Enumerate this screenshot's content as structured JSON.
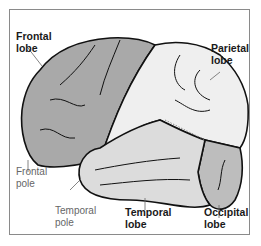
{
  "figure": {
    "colors": {
      "frontal": "#a9a9a9",
      "parietal": "#efefef",
      "temporal": "#dcdcdc",
      "occipital": "#bdbdbd",
      "outline": "#111111",
      "border": "#8a8a8a"
    },
    "labels": {
      "frontal_lobe": [
        "Frontal",
        "lobe"
      ],
      "parietal_lobe": [
        "Parietal",
        "lobe"
      ],
      "frontal_pole": [
        "Frontal",
        "pole"
      ],
      "temporal_pole": [
        "Temporal",
        "pole"
      ],
      "temporal_lobe": [
        "Temporal",
        "lobe"
      ],
      "occipital_lobe": [
        "Occipital",
        "lobe"
      ]
    }
  }
}
